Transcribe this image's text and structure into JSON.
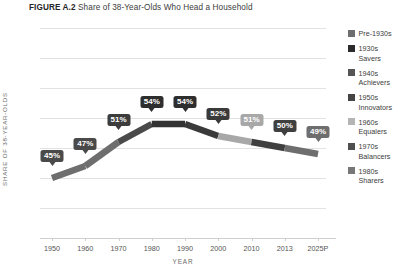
{
  "title": {
    "figure_number": "FIGURE A.2",
    "caption": "Share of 38-Year-Olds Who Head a Household"
  },
  "chart_data": {
    "type": "line",
    "title": "Share of 38-Year-Olds Who Head a Household",
    "xlabel": "YEAR",
    "ylabel": "SHARE OF 38-YEAR-OLDS",
    "categories": [
      "1950",
      "1960",
      "1970",
      "1980",
      "1990",
      "2000",
      "2010",
      "2013",
      "2025P"
    ],
    "values": [
      45,
      47,
      51,
      54,
      54,
      52,
      51,
      50,
      49
    ],
    "data_labels": [
      "45%",
      "47%",
      "51%",
      "54%",
      "54%",
      "52%",
      "51%",
      "50%",
      "49%"
    ],
    "ylim": [
      35,
      70
    ],
    "ytick_labels": [
      "70%",
      "65%",
      "60%",
      "55%",
      "50%",
      "45%",
      "40%",
      "35%"
    ],
    "ytick_values": [
      70,
      65,
      60,
      55,
      50,
      45,
      40,
      35
    ],
    "grid": true,
    "legend_position": "right",
    "segment_colors": [
      "#6e6e6e",
      "#6e6e6e",
      "#4a4a4a",
      "#333333",
      "#3a3a3a",
      "#a8a8a8",
      "#3f3f3f",
      "#6e6e6e"
    ],
    "label_colors": [
      "#4a4a4a",
      "#4a4a4a",
      "#3c3c3c",
      "#2e2e2e",
      "#2e2e2e",
      "#3a3a3a",
      "#a8a8a8",
      "#3f3f3f",
      "#6e6e6e"
    ],
    "series": [
      {
        "name": "Share of 38-Year-Olds Who Head a Household",
        "values": [
          45,
          47,
          51,
          54,
          54,
          52,
          51,
          50,
          49
        ]
      }
    ]
  },
  "legend": {
    "items": [
      {
        "label": "Pre-1930s",
        "color": "#6e6e6e"
      },
      {
        "label": "1930s\nSavers",
        "color": "#2b2b2b"
      },
      {
        "label": "1940s\nAchievers",
        "color": "#555555"
      },
      {
        "label": "1950s\nInnovators",
        "color": "#454545"
      },
      {
        "label": "1960s\nEqualers",
        "color": "#b5b5b5"
      },
      {
        "label": "1970s\nBalancers",
        "color": "#4f4f4f"
      },
      {
        "label": "1980s\nSharers",
        "color": "#777777"
      }
    ]
  },
  "axes": {
    "y_title": "SHARE OF 38-YEAR-OLDS",
    "x_title": "YEAR"
  }
}
